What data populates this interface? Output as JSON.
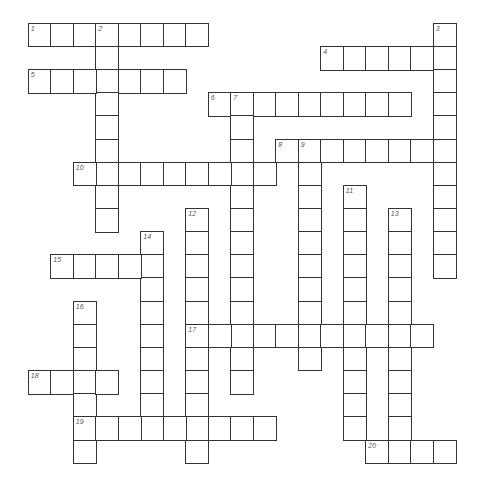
{
  "puzzle": {
    "type": "crossword",
    "grid": {
      "origin_x": 28.5,
      "origin_y": 23.5,
      "cell_w": 22.5,
      "cell_h": 23.15,
      "line_color": "#333333",
      "number_color": "#555555"
    },
    "entries": [
      {
        "number": "1",
        "direction": "across",
        "row": 0,
        "col": 0,
        "length": 8
      },
      {
        "number": "2",
        "direction": "down",
        "row": 0,
        "col": 3,
        "length": 9
      },
      {
        "number": "3",
        "direction": "down",
        "row": 0,
        "col": 18,
        "length": 11
      },
      {
        "number": "4",
        "direction": "across",
        "row": 1,
        "col": 13,
        "length": 6
      },
      {
        "number": "5",
        "direction": "across",
        "row": 2,
        "col": 0,
        "length": 7
      },
      {
        "number": "6",
        "direction": "across",
        "row": 3,
        "col": 8,
        "length": 9
      },
      {
        "number": "7",
        "direction": "down",
        "row": 3,
        "col": 9,
        "length": 13
      },
      {
        "number": "8",
        "direction": "across",
        "row": 5,
        "col": 11,
        "length": 8
      },
      {
        "number": "9",
        "direction": "down",
        "row": 5,
        "col": 12,
        "length": 10
      },
      {
        "number": "10",
        "direction": "across",
        "row": 6,
        "col": 2,
        "length": 9
      },
      {
        "number": "11",
        "direction": "down",
        "row": 7,
        "col": 14,
        "length": 11
      },
      {
        "number": "12",
        "direction": "down",
        "row": 8,
        "col": 7,
        "length": 11
      },
      {
        "number": "13",
        "direction": "down",
        "row": 8,
        "col": 16,
        "length": 11
      },
      {
        "number": "14",
        "direction": "down",
        "row": 9,
        "col": 5,
        "length": 9
      },
      {
        "number": "15",
        "direction": "across",
        "row": 10,
        "col": 1,
        "length": 5
      },
      {
        "number": "16",
        "direction": "down",
        "row": 12,
        "col": 2,
        "length": 7
      },
      {
        "number": "17",
        "direction": "across",
        "row": 13,
        "col": 7,
        "length": 11
      },
      {
        "number": "18",
        "direction": "across",
        "row": 15,
        "col": 0,
        "length": 4
      },
      {
        "number": "19",
        "direction": "across",
        "row": 17,
        "col": 2,
        "length": 9
      },
      {
        "number": "20",
        "direction": "across",
        "row": 18,
        "col": 15,
        "length": 4
      }
    ]
  }
}
